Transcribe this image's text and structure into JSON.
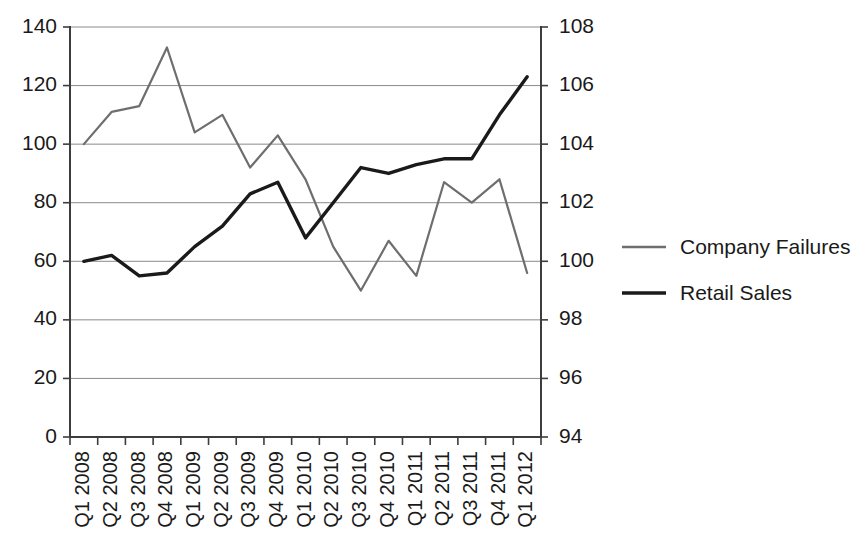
{
  "chart_data": {
    "type": "line",
    "title": "",
    "subtitle": "",
    "xlabel": "",
    "ylabel": "",
    "grid": true,
    "legend_position": "right",
    "categories": [
      "Q1 2008",
      "Q2 2008",
      "Q3 2008",
      "Q4 2008",
      "Q1 2009",
      "Q2 2009",
      "Q3 2009",
      "Q4 2009",
      "Q1 2010",
      "Q2 2010",
      "Q3 2010",
      "Q4 2010",
      "Q1 2011",
      "Q2 2011",
      "Q3 2011",
      "Q4 2011",
      "Q1 2012"
    ],
    "axes": {
      "left": {
        "name": "Company Failures axis",
        "min": 0,
        "max": 140,
        "step": 20,
        "ticks": [
          0,
          20,
          40,
          60,
          80,
          100,
          120,
          140
        ],
        "tick_labels": [
          "0",
          "20",
          "40",
          "60",
          "80",
          "100",
          "120",
          "140"
        ]
      },
      "right": {
        "name": "Retail Sales axis",
        "min": 94,
        "max": 108,
        "step": 2,
        "ticks": [
          94,
          96,
          98,
          100,
          102,
          104,
          106,
          108
        ],
        "tick_labels": [
          "94",
          "96",
          "98",
          "100",
          "102",
          "104",
          "106",
          "108"
        ]
      }
    },
    "series": [
      {
        "name": "Company Failures",
        "axis": "left",
        "color": "#6e6e6e",
        "stroke_width": 2.2,
        "values": [
          100,
          111,
          113,
          133,
          104,
          110,
          92,
          103,
          88,
          65,
          50,
          67,
          55,
          87,
          80,
          88,
          56
        ]
      },
      {
        "name": "Retail Sales",
        "axis": "right",
        "color": "#1a1a1a",
        "stroke_width": 3.4,
        "values": [
          100.0,
          100.2,
          99.5,
          99.6,
          100.5,
          101.2,
          102.3,
          102.7,
          100.8,
          102.0,
          103.2,
          103.0,
          103.3,
          103.5,
          103.5,
          105.0,
          106.3
        ]
      }
    ]
  },
  "legend": {
    "entries": [
      {
        "label": "Company Failures",
        "color": "#6e6e6e"
      },
      {
        "label": "Retail Sales",
        "color": "#1a1a1a"
      }
    ]
  },
  "colors": {
    "background": "#ffffff",
    "grid": "#8a8a8a",
    "axis": "#3d3d3d",
    "text": "#1a1a1a",
    "company_failures": "#6e6e6e",
    "retail_sales": "#1a1a1a"
  }
}
